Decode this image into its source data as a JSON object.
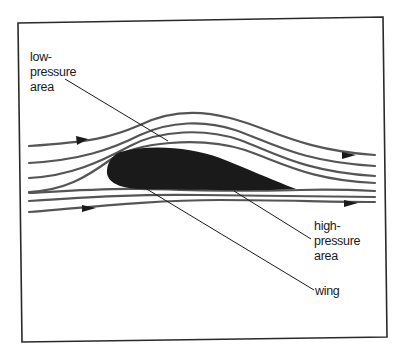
{
  "diagram": {
    "colors": {
      "background": "#ffffff",
      "frame": "#2a2a2a",
      "streamline": "#555555",
      "wing": "#1a1a1a",
      "leader": "#1a1a1a",
      "text": "#1a1a1a"
    },
    "labels": {
      "low_pressure": "low-\npressure\narea",
      "high_pressure": "high-\npressure\narea",
      "wing": "wing"
    },
    "arrows": [
      {
        "position": "upper-left",
        "direction": "right"
      },
      {
        "position": "upper-right",
        "direction": "right"
      },
      {
        "position": "lower-left",
        "direction": "right"
      },
      {
        "position": "lower-right",
        "direction": "right"
      }
    ]
  }
}
